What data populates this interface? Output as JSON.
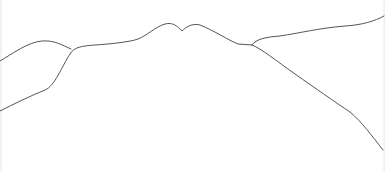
{
  "drawing": {
    "background": "#ffffff",
    "stroke_color": "#555555",
    "stroke_width": 1,
    "lines": [
      {
        "name": "left-upper-ridge",
        "path": "M0,61 C12,54 28,42 42,41 C54,40 62,45 71,49"
      },
      {
        "name": "main-ridge",
        "path": "M0,111 C14,104 30,96 45,90 C55,86 62,66 70,54 C74,47 82,46 95,45 C110,44 130,42 138,39 C148,35 155,27 165,24 C173,22 177,26 182,31 C186,27 192,23 200,25 C215,31 228,40 238,44 L252,45"
      },
      {
        "name": "right-upper-branch",
        "path": "M252,45 C256,39 266,37 280,36 C300,33 320,28 345,26 C362,25 375,21 384,16"
      },
      {
        "name": "right-lower-branch",
        "path": "M252,45 C262,49 275,60 295,74 C315,88 335,102 350,112 C362,122 372,136 383,150"
      }
    ]
  }
}
